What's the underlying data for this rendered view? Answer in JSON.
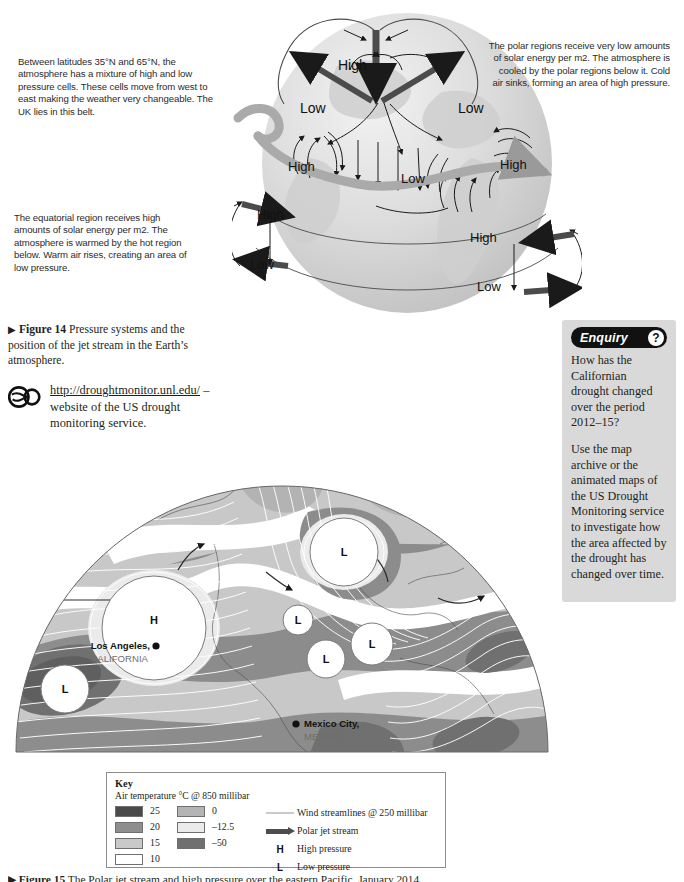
{
  "figure14": {
    "caption_marker": "▶",
    "caption_bold": "Figure 14",
    "caption_rest": " Pressure systems and the position of the jet stream in the Earth’s atmosphere.",
    "annotations": {
      "midlatitude": "Between latitudes 35°N and 65°N, the atmosphere has a mixture of high and low pressure cells. These cells move from west to east making the weather very changeable. The UK lies in this belt.",
      "equatorial": "The equatorial region receives high amounts of solar energy per m2. The atmosphere is warmed by the hot region below. Warm air rises, creating an area of low pressure.",
      "polar": "The polar regions receive very low amounts of solar energy per m2. The atmosphere is cooled by the polar regions below it. Cold air sinks, forming an area of high pressure."
    },
    "globe_labels": [
      {
        "id": "polar-high",
        "text": "High",
        "x": 362,
        "y": 65
      },
      {
        "id": "polar-low-left",
        "text": "Low",
        "x": 320,
        "y": 110
      },
      {
        "id": "polar-low-right",
        "text": "Low",
        "x": 478,
        "y": 110
      },
      {
        "id": "mid-high-left",
        "text": "High",
        "x": 305,
        "y": 168
      },
      {
        "id": "mid-low-centre",
        "text": "Low",
        "x": 418,
        "y": 180
      },
      {
        "id": "mid-high-right",
        "text": "High",
        "x": 519,
        "y": 166
      },
      {
        "id": "eq-high-left",
        "text": "High",
        "x": 275,
        "y": 216
      },
      {
        "id": "eq-low-left",
        "text": "Low",
        "x": 268,
        "y": 266
      },
      {
        "id": "eq-high-right",
        "text": "High",
        "x": 489,
        "y": 239
      },
      {
        "id": "eq-low-right",
        "text": "Low",
        "x": 496,
        "y": 288
      }
    ]
  },
  "weblink": {
    "icon": "glasses-icon",
    "url": "http://droughtmonitor.unl.edu/",
    "url_line1": "http://droughtmonitor.",
    "url_line2": "unl.edu/",
    "tail": " – website of the US drought monitoring service."
  },
  "enquiry": {
    "title": "Enquiry",
    "badge": "?",
    "paragraphs": [
      "How has the Californian drought changed over the period 2012–15?",
      "Use the map archive or the animated maps of the US Drought Monitoring service to investigate how the area affected by the drought has changed over time."
    ],
    "panel_color": "#d9d9d9",
    "header_color": "#111111"
  },
  "map": {
    "pressure_markers": [
      {
        "id": "high-pacific",
        "label": "H",
        "cx": 146,
        "cy": 176,
        "r": 52
      },
      {
        "id": "low-canada",
        "label": "L",
        "cx": 336,
        "cy": 100,
        "r": 34
      },
      {
        "id": "low-southwest",
        "label": "L",
        "cx": 57,
        "cy": 237,
        "r": 24
      },
      {
        "id": "low-central",
        "label": "L",
        "cx": 290,
        "cy": 168,
        "r": 15
      },
      {
        "id": "low-gulf",
        "label": "L",
        "cx": 318,
        "cy": 207,
        "r": 19
      },
      {
        "id": "low-atlantic",
        "label": "L",
        "cx": 364,
        "cy": 192,
        "r": 21
      }
    ],
    "places": [
      {
        "id": "los-angeles",
        "name": "Los Angeles,",
        "region": "CALIFORNIA",
        "dot_x": 148,
        "dot_y": 194,
        "label_x": 142,
        "label_y": 197,
        "region_x": 108,
        "region_y": 210,
        "anchor": "end"
      },
      {
        "id": "mexico-city",
        "name": "Mexico City,",
        "region": "MEXICO",
        "dot_x": 288,
        "dot_y": 272,
        "label_x": 296,
        "label_y": 275,
        "region_x": 296,
        "region_y": 288,
        "anchor": "start"
      }
    ]
  },
  "key": {
    "title": "Key",
    "subtitle": "Air temperature °C @ 850 millibar",
    "temperature_left": [
      {
        "label": "25",
        "color": "#4a4a4a"
      },
      {
        "label": "20",
        "color": "#8e8e8e"
      },
      {
        "label": "15",
        "color": "#c9c9c9"
      },
      {
        "label": "10",
        "color": "#ffffff"
      }
    ],
    "temperature_right": [
      {
        "label": "0",
        "color": "#b4b4b4"
      },
      {
        "label": "–12.5",
        "color": "#ebebeb"
      },
      {
        "label": "–50",
        "color": "#707070"
      }
    ],
    "symbols": [
      {
        "id": "wind-streamlines",
        "type": "line",
        "label": "Wind streamlines @ 250 millibar"
      },
      {
        "id": "polar-jet-stream",
        "type": "arrow",
        "label": "Polar jet stream"
      },
      {
        "id": "high-pressure",
        "type": "letter",
        "glyph": "H",
        "label": "High pressure"
      },
      {
        "id": "low-pressure",
        "type": "letter",
        "glyph": "L",
        "label": "Low pressure"
      }
    ]
  },
  "figure15": {
    "caption_marker": "▶",
    "caption_bold": "Figure 15",
    "caption_rest": " The Polar jet stream and high pressure over the eastern Pacific, January 2014."
  }
}
